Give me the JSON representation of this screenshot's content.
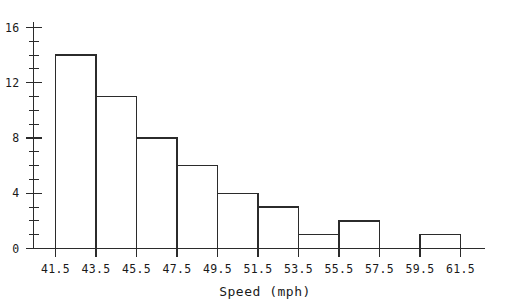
{
  "chart_data": {
    "type": "bar",
    "title": "",
    "subtitle": "",
    "xlabel": "Speed (mph)",
    "ylabel": "",
    "bin_edges": [
      41.5,
      43.5,
      45.5,
      47.5,
      49.5,
      51.5,
      53.5,
      55.5,
      57.5,
      59.5,
      61.5
    ],
    "categories": [
      "41.5-43.5",
      "43.5-45.5",
      "45.5-47.5",
      "47.5-49.5",
      "49.5-51.5",
      "51.5-53.5",
      "53.5-55.5",
      "55.5-57.5",
      "57.5-59.5",
      "59.5-61.5"
    ],
    "values": [
      14,
      11,
      8,
      6,
      4,
      3,
      1,
      2,
      0,
      1
    ],
    "bin_width": 2,
    "xlim": [
      41.5,
      61.5
    ],
    "ylim": [
      0,
      16
    ],
    "x_tick_labels": [
      "41.5",
      "43.5",
      "45.5",
      "47.5",
      "49.5",
      "51.5",
      "53.5",
      "55.5",
      "57.5",
      "59.5",
      "61.5"
    ],
    "y_tick_labels": [
      "0",
      "4",
      "8",
      "12",
      "16"
    ],
    "y_major_ticks": [
      0,
      4,
      8,
      12,
      16
    ],
    "y_minor_tick_step": 1,
    "grid": false,
    "legend": null,
    "colors": {
      "line": "#2b2b2b",
      "text": "#1a1a1a",
      "background": "#ffffff",
      "bar_fill": "none"
    }
  }
}
